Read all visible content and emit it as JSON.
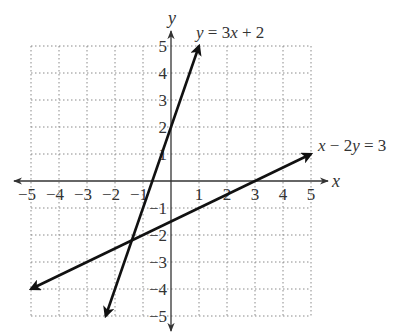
{
  "chart_data": {
    "type": "line",
    "title": "",
    "xlabel": "x",
    "ylabel": "y",
    "xlim": [
      -5,
      5
    ],
    "ylim": [
      -5,
      5
    ],
    "grid": true,
    "x_ticks": [
      -5,
      -4,
      -3,
      -2,
      -1,
      1,
      2,
      3,
      4,
      5
    ],
    "y_ticks": [
      -5,
      -4,
      -3,
      -2,
      -1,
      1,
      2,
      3,
      4,
      5
    ],
    "x_tick_labels": [
      "−5",
      "−4",
      "−3",
      "−2",
      "−1",
      "1",
      "2",
      "3",
      "4",
      "5"
    ],
    "y_tick_labels": [
      "−5",
      "−4",
      "−3",
      "−2",
      "−1",
      "1",
      "2",
      "3",
      "4",
      "5"
    ],
    "series": [
      {
        "name": "y = 3x + 2",
        "equation": "y = 3x + 2",
        "slope": 3,
        "intercept": 2,
        "x": [
          -2.333,
          1
        ],
        "y": [
          -5,
          5
        ],
        "arrows": "both"
      },
      {
        "name": "x − 2y = 3",
        "equation": "x − 2y = 3",
        "slope": 0.5,
        "intercept": -1.5,
        "x": [
          -5,
          5
        ],
        "y": [
          -4,
          1
        ],
        "arrows": "both"
      }
    ],
    "intersection": {
      "x": -1.4,
      "y": -2.2
    },
    "annotations": [
      {
        "text": "y = 3x + 2",
        "near": [
          1,
          5
        ]
      },
      {
        "text": "x − 2y = 3",
        "near": [
          5,
          1
        ]
      }
    ],
    "legend": "none"
  },
  "labels": {
    "x_axis": "x",
    "y_axis": "y",
    "line1": {
      "p1": "y",
      "p2": " = 3",
      "p3": "x",
      "p4": " + 2"
    },
    "line2": {
      "p1": "x",
      "p2": " − 2",
      "p3": "y",
      "p4": " = 3"
    }
  }
}
